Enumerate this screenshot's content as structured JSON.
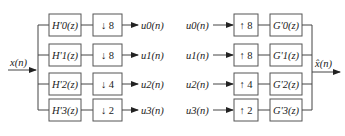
{
  "diagram": {
    "type": "multirate filter bank",
    "analysis": {
      "input": "x(n)",
      "branches": [
        {
          "filter": "H'0(z)",
          "filter_base": "H",
          "sub": "0",
          "op": "↓ 8",
          "output": "u0(n)"
        },
        {
          "filter": "H'1(z)",
          "filter_base": "H",
          "sub": "1",
          "op": "↓ 8",
          "output": "u1(n)"
        },
        {
          "filter": "H'2(z)",
          "filter_base": "H",
          "sub": "2",
          "op": "↓ 4",
          "output": "u2(n)"
        },
        {
          "filter": "H'3(z)",
          "filter_base": "H",
          "sub": "3",
          "op": "↓ 2",
          "output": "u3(n)"
        }
      ]
    },
    "synthesis": {
      "output": "x̂(n)",
      "branches": [
        {
          "input": "u0(n)",
          "op": "↑ 8",
          "filter": "G'0(z)",
          "filter_base": "G",
          "sub": "0"
        },
        {
          "input": "u1(n)",
          "op": "↑ 8",
          "filter": "G'1(z)",
          "filter_base": "G",
          "sub": "1"
        },
        {
          "input": "u2(n)",
          "op": "↑ 4",
          "filter": "G'2(z)",
          "filter_base": "G",
          "sub": "2"
        },
        {
          "input": "u3(n)",
          "op": "↑ 2",
          "filter": "G'3(z)",
          "filter_base": "G",
          "sub": "3"
        }
      ]
    }
  }
}
